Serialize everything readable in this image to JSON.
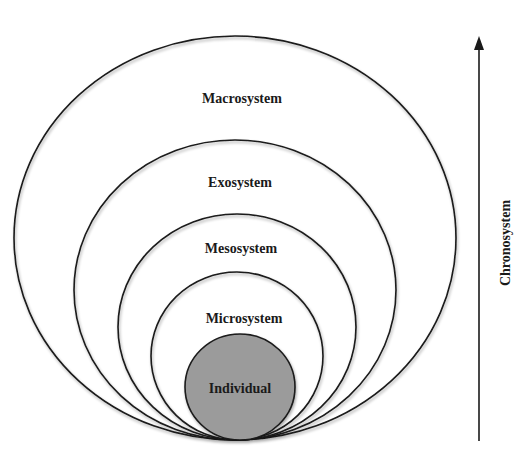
{
  "diagram": {
    "colors": {
      "stroke": "#1a1a1a",
      "core_fill": "#9b9b9b",
      "background": "#ffffff"
    },
    "layers": [
      {
        "name": "Macrosystem"
      },
      {
        "name": "Exosystem"
      },
      {
        "name": "Mesosystem"
      },
      {
        "name": "Microsystem"
      },
      {
        "name": "Individual"
      }
    ],
    "axis": {
      "label": "Chronosystem",
      "direction": "up"
    }
  }
}
